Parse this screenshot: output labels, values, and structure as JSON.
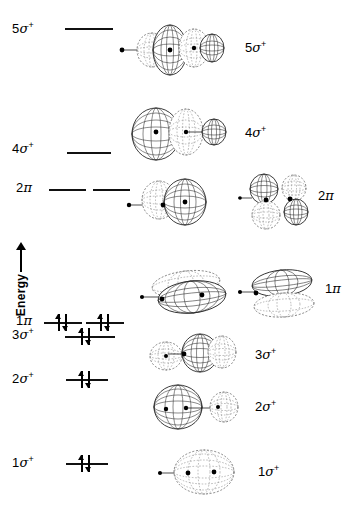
{
  "figure": {
    "kind": "molecular-orbital-energy-diagram",
    "axis": {
      "label": "Energy",
      "direction_icon": "up-arrow-icon"
    }
  },
  "levels": [
    {
      "key": "5sigma",
      "base": "5",
      "greek": "σ",
      "sup": "+",
      "label_plain": "5σ+",
      "lines": 1,
      "electrons_per_line": [
        0
      ]
    },
    {
      "key": "4sigma",
      "base": "4",
      "greek": "σ",
      "sup": "+",
      "label_plain": "4σ+",
      "lines": 1,
      "electrons_per_line": [
        0
      ]
    },
    {
      "key": "2pi",
      "base": "2",
      "greek": "π",
      "sup": "",
      "label_plain": "2π",
      "lines": 2,
      "electrons_per_line": [
        0,
        0
      ]
    },
    {
      "key": "1pi",
      "base": "1",
      "greek": "π",
      "sup": "",
      "label_plain": "1π",
      "lines": 2,
      "electrons_per_line": [
        2,
        2
      ]
    },
    {
      "key": "3sigma",
      "base": "3",
      "greek": "σ",
      "sup": "+",
      "label_plain": "3σ+",
      "lines": 1,
      "electrons_per_line": [
        2
      ]
    },
    {
      "key": "2sigma",
      "base": "2",
      "greek": "σ",
      "sup": "+",
      "label_plain": "2σ+",
      "lines": 1,
      "electrons_per_line": [
        2
      ]
    },
    {
      "key": "1sigma",
      "base": "1",
      "greek": "σ",
      "sup": "+",
      "label_plain": "1σ+",
      "lines": 1,
      "electrons_per_line": [
        2
      ]
    }
  ],
  "orbital_pictures": [
    {
      "key": "5sigma",
      "base": "5",
      "greek": "σ",
      "sup": "+",
      "lobes": 4
    },
    {
      "key": "4sigma",
      "base": "4",
      "greek": "σ",
      "sup": "+",
      "lobes": 3
    },
    {
      "key": "2pi",
      "base": "2",
      "greek": "π",
      "sup": "",
      "lobes": 4
    },
    {
      "key": "1pi",
      "base": "1",
      "greek": "π",
      "sup": "",
      "lobes": 2
    },
    {
      "key": "3sigma",
      "base": "3",
      "greek": "σ",
      "sup": "+",
      "lobes": 3
    },
    {
      "key": "2sigma",
      "base": "2",
      "greek": "σ",
      "sup": "+",
      "lobes": 2
    },
    {
      "key": "1sigma",
      "base": "1",
      "greek": "σ",
      "sup": "+",
      "lobes": 1
    }
  ],
  "colors": {
    "ink": "#111111",
    "background": "#ffffff",
    "dashed_phase": "#777777"
  }
}
